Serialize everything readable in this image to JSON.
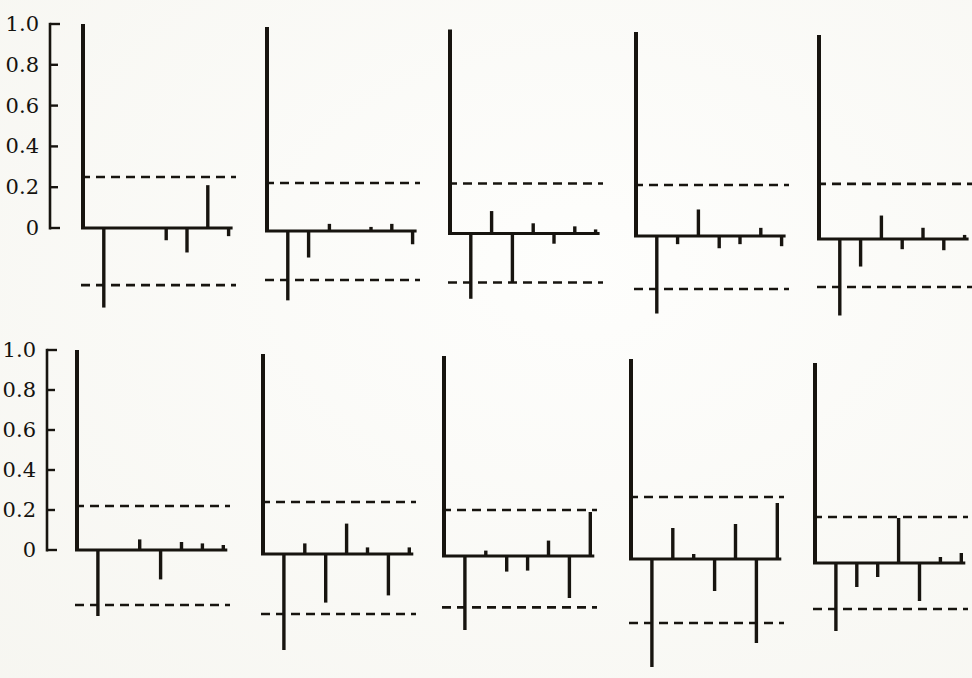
{
  "figure": {
    "kind": "grid-of-correlograms",
    "rows": 2,
    "cols": 5,
    "ink_color": "#17140f",
    "paper_color": "#fcfcf8"
  },
  "y_axis": {
    "tick_labels": [
      "1.0",
      "0.8",
      "0.6",
      "0.4",
      "0.2",
      "0"
    ],
    "tick_values": [
      1.0,
      0.8,
      0.6,
      0.4,
      0.2,
      0.0
    ]
  },
  "chart_data": [
    {
      "type": "bar",
      "name": "acf-r1c1",
      "row": 0,
      "col": 0,
      "x": [
        0,
        1,
        2,
        3,
        4,
        5,
        6,
        7
      ],
      "values": [
        1.0,
        -0.39,
        0.0,
        0.0,
        -0.06,
        -0.12,
        0.21,
        -0.04
      ],
      "band_upper": 0.25,
      "band_lower": -0.28,
      "title": "",
      "xlabel": "",
      "ylabel": "",
      "ylim": [
        -0.6,
        1.0
      ],
      "grid": false,
      "layout": {
        "x0": 83,
        "baseline_y": 228,
        "scale": 204,
        "lag_dx": 20.8,
        "show_axis": true,
        "axis_x": 50
      }
    },
    {
      "type": "bar",
      "name": "acf-r1c2",
      "row": 0,
      "col": 1,
      "x": [
        0,
        1,
        2,
        3,
        4,
        5,
        6,
        7
      ],
      "values": [
        1.0,
        -0.34,
        -0.13,
        0.035,
        0.0,
        0.02,
        0.035,
        -0.065
      ],
      "band_upper": 0.235,
      "band_lower": -0.24,
      "title": "",
      "xlabel": "",
      "ylabel": "",
      "ylim": [
        -0.6,
        1.0
      ],
      "grid": false,
      "layout": {
        "x0": 267,
        "baseline_y": 231,
        "scale": 204,
        "lag_dx": 20.8,
        "show_axis": false
      }
    },
    {
      "type": "bar",
      "name": "acf-r1c3",
      "row": 0,
      "col": 2,
      "x": [
        0,
        1,
        2,
        3,
        4,
        5,
        6,
        7
      ],
      "values": [
        1.0,
        -0.32,
        0.11,
        -0.24,
        0.05,
        -0.05,
        0.035,
        0.02
      ],
      "band_upper": 0.245,
      "band_lower": -0.24,
      "title": "",
      "xlabel": "",
      "ylabel": "",
      "ylim": [
        -0.6,
        1.0
      ],
      "grid": false,
      "layout": {
        "x0": 450,
        "baseline_y": 233.5,
        "scale": 204,
        "lag_dx": 20.8,
        "show_axis": false
      }
    },
    {
      "type": "bar",
      "name": "acf-r1c4",
      "row": 0,
      "col": 3,
      "x": [
        0,
        1,
        2,
        3,
        4,
        5,
        6,
        7
      ],
      "values": [
        1.0,
        -0.38,
        -0.04,
        0.13,
        -0.06,
        -0.04,
        0.04,
        -0.05
      ],
      "band_upper": 0.25,
      "band_lower": -0.26,
      "title": "",
      "xlabel": "",
      "ylabel": "",
      "ylim": [
        -0.6,
        1.0
      ],
      "grid": false,
      "layout": {
        "x0": 636,
        "baseline_y": 236,
        "scale": 204,
        "lag_dx": 20.8,
        "show_axis": false
      }
    },
    {
      "type": "bar",
      "name": "acf-r1c5",
      "row": 0,
      "col": 4,
      "x": [
        0,
        1,
        2,
        3,
        4,
        5,
        6,
        7
      ],
      "values": [
        1.0,
        -0.375,
        -0.135,
        0.115,
        -0.05,
        0.055,
        -0.055,
        0.02
      ],
      "band_upper": 0.27,
      "band_lower": -0.235,
      "title": "",
      "xlabel": "",
      "ylabel": "",
      "ylim": [
        -0.6,
        1.0
      ],
      "grid": false,
      "layout": {
        "x0": 819,
        "baseline_y": 239,
        "scale": 204,
        "lag_dx": 20.8,
        "show_axis": false
      }
    },
    {
      "type": "bar",
      "name": "acf-r2c1",
      "row": 1,
      "col": 0,
      "x": [
        0,
        1,
        2,
        3,
        4,
        5,
        6,
        7
      ],
      "values": [
        1.0,
        -0.33,
        0.0,
        0.053,
        -0.147,
        0.04,
        0.033,
        0.025
      ],
      "band_upper": 0.22,
      "band_lower": -0.275,
      "title": "",
      "xlabel": "",
      "ylabel": "",
      "ylim": [
        -0.7,
        1.0
      ],
      "grid": false,
      "layout": {
        "x0": 77,
        "baseline_y": 550,
        "scale": 200,
        "lag_dx": 20.9,
        "show_axis": true,
        "axis_x": 47
      }
    },
    {
      "type": "bar",
      "name": "acf-r2c2",
      "row": 1,
      "col": 1,
      "x": [
        0,
        1,
        2,
        3,
        4,
        5,
        6,
        7
      ],
      "values": [
        1.0,
        -0.48,
        0.053,
        -0.243,
        0.152,
        0.033,
        -0.207,
        0.033
      ],
      "band_upper": 0.26,
      "band_lower": -0.3,
      "title": "",
      "xlabel": "",
      "ylabel": "",
      "ylim": [
        -0.7,
        1.0
      ],
      "grid": false,
      "layout": {
        "x0": 263,
        "baseline_y": 554,
        "scale": 200,
        "lag_dx": 20.9,
        "show_axis": false
      }
    },
    {
      "type": "bar",
      "name": "acf-r2c3",
      "row": 1,
      "col": 2,
      "x": [
        0,
        1,
        2,
        3,
        4,
        5,
        6,
        7
      ],
      "values": [
        1.0,
        -0.37,
        0.027,
        -0.078,
        -0.073,
        0.077,
        -0.21,
        0.22
      ],
      "band_upper": 0.23,
      "band_lower": -0.257,
      "title": "",
      "xlabel": "",
      "ylabel": "",
      "ylim": [
        -0.7,
        1.0
      ],
      "grid": false,
      "layout": {
        "x0": 444,
        "baseline_y": 556,
        "scale": 200,
        "lag_dx": 20.9,
        "show_axis": false
      }
    },
    {
      "type": "bar",
      "name": "acf-r2c4",
      "row": 1,
      "col": 3,
      "x": [
        0,
        1,
        2,
        3,
        4,
        5,
        6,
        7
      ],
      "values": [
        1.0,
        -0.54,
        0.155,
        0.025,
        -0.16,
        0.175,
        -0.42,
        0.28
      ],
      "band_upper": 0.31,
      "band_lower": -0.32,
      "title": "",
      "xlabel": "",
      "ylabel": "",
      "ylim": [
        -0.7,
        1.0
      ],
      "grid": false,
      "layout": {
        "x0": 631,
        "baseline_y": 559,
        "scale": 200,
        "lag_dx": 20.9,
        "show_axis": false
      }
    },
    {
      "type": "bar",
      "name": "acf-r2c5",
      "row": 1,
      "col": 4,
      "x": [
        0,
        1,
        2,
        3,
        4,
        5,
        6,
        7
      ],
      "values": [
        1.0,
        -0.34,
        -0.12,
        -0.07,
        0.225,
        -0.19,
        0.03,
        0.05
      ],
      "band_upper": 0.23,
      "band_lower": -0.23,
      "title": "",
      "xlabel": "",
      "ylabel": "",
      "ylim": [
        -0.7,
        1.0
      ],
      "grid": false,
      "layout": {
        "x0": 815,
        "baseline_y": 563,
        "scale": 200,
        "lag_dx": 20.9,
        "show_axis": false
      }
    }
  ],
  "style": {
    "spike_width_lag0": 4.0,
    "spike_width": 3.4,
    "baseline_width": 3.0,
    "dash_width": 2.6,
    "dash_pattern": "9,6",
    "tick_font_px": 21
  }
}
